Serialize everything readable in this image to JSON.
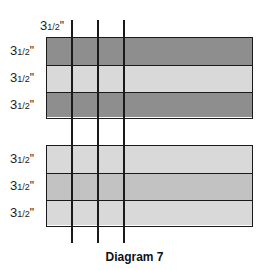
{
  "diagram": {
    "caption": "Diagram 7",
    "column_label": {
      "whole": "3",
      "frac": "1/2",
      "unit": "\""
    },
    "strip_sets": [
      {
        "rows": [
          {
            "label": {
              "whole": "3",
              "frac": "1/2",
              "unit": "\""
            },
            "fill": "#8e8e8e"
          },
          {
            "label": {
              "whole": "3",
              "frac": "1/2",
              "unit": "\""
            },
            "fill": "#d9d9d9"
          },
          {
            "label": {
              "whole": "3",
              "frac": "1/2",
              "unit": "\""
            },
            "fill": "#8e8e8e"
          }
        ]
      },
      {
        "rows": [
          {
            "label": {
              "whole": "3",
              "frac": "1/2",
              "unit": "\""
            },
            "fill": "#d9d9d9"
          },
          {
            "label": {
              "whole": "3",
              "frac": "1/2",
              "unit": "\""
            },
            "fill": "#c2c2c2"
          },
          {
            "label": {
              "whole": "3",
              "frac": "1/2",
              "unit": "\""
            },
            "fill": "#d9d9d9"
          }
        ]
      }
    ],
    "line_color": "#1a1a1a"
  }
}
